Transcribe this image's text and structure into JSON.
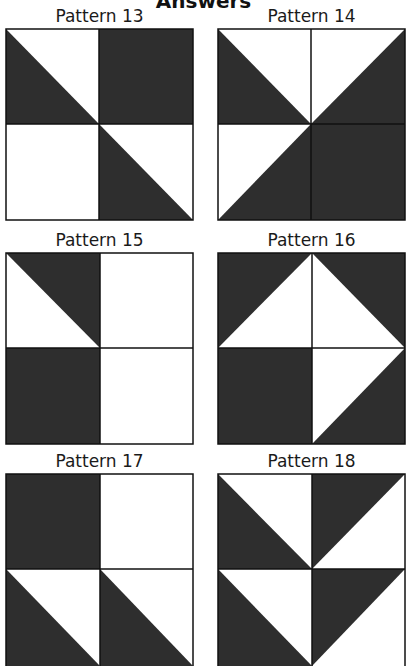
{
  "page": {
    "title": "Answers"
  },
  "colors": {
    "dark": "#2e2e2e",
    "light": "#ffffff",
    "line": "#111111"
  },
  "patterns": [
    {
      "label": "Pattern 13",
      "quadrants": {
        "top_left": "diagonal-split: bottom-left dark, top-right light",
        "top_right": "solid dark",
        "bottom_left": "solid light",
        "bottom_right": "diagonal-split: bottom-left dark, top-right light"
      }
    },
    {
      "label": "Pattern 14",
      "quadrants": {
        "top_left": "diagonal-split: bottom-left dark, top-right light",
        "top_right": "diagonal-split: bottom-right dark, top-left light",
        "bottom_left": "diagonal-split: bottom-right dark, top-left light",
        "bottom_right": "solid dark"
      }
    },
    {
      "label": "Pattern 15",
      "quadrants": {
        "top_left": "diagonal-split: top-right dark, bottom-left light",
        "top_right": "solid light",
        "bottom_left": "solid dark",
        "bottom_right": "solid light"
      }
    },
    {
      "label": "Pattern 16",
      "quadrants": {
        "top_left": "diagonal-split: top-left dark, bottom-right light",
        "top_right": "diagonal-split: top-right dark, bottom-left light",
        "bottom_left": "solid dark",
        "bottom_right": "diagonal-split: bottom-right dark, top-left light"
      }
    },
    {
      "label": "Pattern 17",
      "quadrants": {
        "top_left": "solid dark",
        "top_right": "solid light",
        "bottom_left": "diagonal-split: bottom-left dark, top-right light",
        "bottom_right": "diagonal-split: bottom-left dark, top-right light"
      }
    },
    {
      "label": "Pattern 18",
      "quadrants": {
        "top_left": "diagonal-split: bottom-left dark, top-right light",
        "top_right": "diagonal-split: top-left dark, bottom-right light",
        "bottom_left": "diagonal-split: bottom-left dark, top-right light",
        "bottom_right": "diagonal-split: top-left dark, bottom-right light"
      }
    }
  ]
}
